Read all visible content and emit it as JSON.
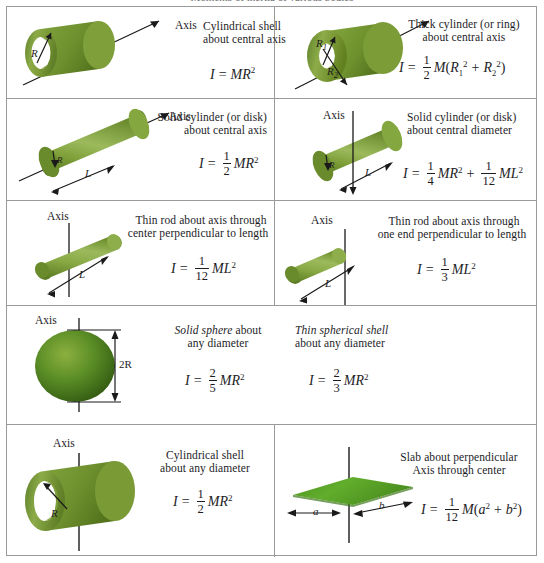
{
  "top_caption": "Moments of inertia of various bodies",
  "colors": {
    "green_dark": "#5d7f2a",
    "green_mid": "#74962f",
    "green_light": "#9fbc5e",
    "slab_green": "#55a22a",
    "border": "#9a9a9a",
    "ink": "#1d1d1f"
  },
  "rows": [
    {
      "id": "row-1",
      "left": {
        "shape": "cylindrical-shell",
        "axis_label": "Axis",
        "radius_label": "R",
        "caption_line1": "Cylindrical shell",
        "caption_line2": "about central axis",
        "formula": "I = MR²",
        "formula_parts": {
          "I": "I",
          "eq": "=",
          "M": "M",
          "R": "R",
          "exp": "2"
        }
      },
      "right": {
        "shape": "thick-cylinder",
        "radius_label_1": "R",
        "radius_sub_1": "1",
        "radius_label_2": "R",
        "radius_sub_2": "2",
        "caption_line1": "Thick cylinder (or ring)",
        "caption_line2": "about central axis",
        "formula": "I = ½M(R₁² + R₂²)",
        "formula_parts": {
          "I": "I",
          "eq": "=",
          "num": "1",
          "den": "2",
          "M": "M",
          "open": "(",
          "R": "R",
          "s1": "1",
          "s2": "2",
          "exp": "2",
          "plus": "+",
          "close": ")"
        }
      }
    },
    {
      "id": "row-2",
      "left": {
        "shape": "solid-cylinder-central-axis",
        "axis_label": "Axis",
        "radius_label": "R",
        "length_label": "L",
        "caption_line1": "Solid cylinder (or disk)",
        "caption_line2": "about central axis",
        "formula": "I = ½MR²",
        "formula_parts": {
          "I": "I",
          "eq": "=",
          "num": "1",
          "den": "2",
          "M": "M",
          "R": "R",
          "exp": "2"
        }
      },
      "right": {
        "shape": "solid-cylinder-central-diameter",
        "axis_label": "Axis",
        "radius_label": "R",
        "length_label": "L",
        "caption_line1": "Solid cylinder (or disk)",
        "caption_line2": "about central diameter",
        "formula": "I = ¼MR² + 1/12 ML²",
        "formula_parts": {
          "I": "I",
          "eq": "=",
          "num1": "1",
          "den1": "4",
          "M": "M",
          "R": "R",
          "exp": "2",
          "plus": "+",
          "num2": "1",
          "den2": "12",
          "L": "L"
        }
      }
    },
    {
      "id": "row-3",
      "left": {
        "shape": "thin-rod-center",
        "axis_label": "Axis",
        "length_label": "L",
        "caption_line1": "Thin rod about axis through",
        "caption_line2": "center perpendicular to length",
        "formula": "I = 1/12 ML²",
        "formula_parts": {
          "I": "I",
          "eq": "=",
          "num": "1",
          "den": "12",
          "M": "M",
          "L": "L",
          "exp": "2"
        }
      },
      "right": {
        "shape": "thin-rod-end",
        "axis_label": "Axis",
        "length_label": "L",
        "caption_line1": "Thin rod about axis through",
        "caption_line2": "one end perpendicular to length",
        "formula": "I = ⅓ML²",
        "formula_parts": {
          "I": "I",
          "eq": "=",
          "num": "1",
          "den": "3",
          "M": "M",
          "L": "L",
          "exp": "2"
        }
      }
    },
    {
      "id": "row-4",
      "full": {
        "shape": "sphere",
        "axis_label": "Axis",
        "diameter_label": "2R",
        "item_a": {
          "caption_line1_em": "Solid sphere",
          "caption_line1_rest": " about",
          "caption_line2": "any diameter",
          "formula": "I = ⅖MR²",
          "formula_parts": {
            "I": "I",
            "eq": "=",
            "num": "2",
            "den": "5",
            "M": "M",
            "R": "R",
            "exp": "2"
          }
        },
        "item_b": {
          "caption_line1_em": "Thin spherical shell",
          "caption_line2": "about any diameter",
          "formula": "I = ⅔MR²",
          "formula_parts": {
            "I": "I",
            "eq": "=",
            "num": "2",
            "den": "3",
            "M": "M",
            "R": "R",
            "exp": "2"
          }
        }
      }
    },
    {
      "id": "row-5",
      "left": {
        "shape": "cylindrical-shell-diameter",
        "axis_label": "Axis",
        "radius_label": "R",
        "caption_line1": "Cylindrical shell",
        "caption_line2": "about any diameter",
        "formula": "I = ½MR²",
        "formula_parts": {
          "I": "I",
          "eq": "=",
          "num": "1",
          "den": "2",
          "M": "M",
          "R": "R",
          "exp": "2"
        }
      },
      "right": {
        "shape": "slab",
        "side_a_label": "a",
        "side_b_label": "b",
        "caption_line1": "Slab about perpendicular",
        "caption_line2": "Axis through center",
        "formula": "I = 1/12 M(a² + b²)",
        "formula_parts": {
          "I": "I",
          "eq": "=",
          "num": "1",
          "den": "12",
          "M": "M",
          "open": "(",
          "a": "a",
          "b": "b",
          "exp": "2",
          "plus": "+",
          "close": ")"
        }
      }
    }
  ]
}
